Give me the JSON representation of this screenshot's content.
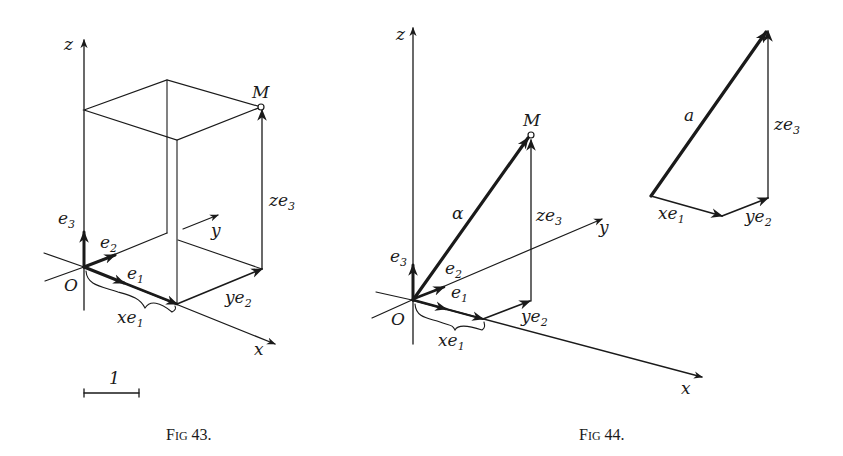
{
  "figures": [
    {
      "caption": {
        "prefix": "F",
        "smallcaps": "IG",
        "number": "43."
      },
      "labels": {
        "z_axis": "z",
        "y_axis": "y",
        "x_axis": "x",
        "origin": "O",
        "point": "M",
        "e1": "e",
        "e1_sub": "1",
        "e2": "e",
        "e2_sub": "2",
        "e3": "e",
        "e3_sub": "3",
        "xe1": "xe",
        "xe1_sub": "1",
        "ye2": "ye",
        "ye2_sub": "2",
        "ze3": "ze",
        "ze3_sub": "3",
        "scale": "1"
      }
    },
    {
      "caption": {
        "prefix": "F",
        "smallcaps": "IG",
        "number": "44."
      },
      "labels": {
        "z_axis": "z",
        "y_axis": "y",
        "x_axis": "x",
        "origin": "O",
        "point": "M",
        "vector": "α",
        "e1": "e",
        "e1_sub": "1",
        "e2": "e",
        "e2_sub": "2",
        "e3": "e",
        "e3_sub": "3",
        "xe1": "xe",
        "xe1_sub": "1",
        "ye2": "ye",
        "ye2_sub": "2",
        "ze3": "ze",
        "ze3_sub": "3"
      },
      "triangle_labels": {
        "vector": "a",
        "xe1": "xe",
        "xe1_sub": "1",
        "ye2": "ye",
        "ye2_sub": "2",
        "ze3": "ze",
        "ze3_sub": "3"
      }
    }
  ],
  "colors": {
    "ink": "#1a1a1a",
    "background": "#ffffff"
  }
}
